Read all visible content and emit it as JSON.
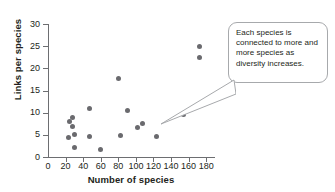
{
  "chart_data": {
    "type": "scatter",
    "title": "",
    "xlabel": "Number of species",
    "ylabel": "Links per species",
    "xlim": [
      0,
      190
    ],
    "ylim": [
      0,
      30
    ],
    "grid": false,
    "legend": null,
    "xticks": [
      0,
      20,
      40,
      60,
      80,
      100,
      120,
      140,
      160,
      180
    ],
    "xtick_labels": [
      "0",
      "20",
      "40",
      "60",
      "80",
      "100",
      "120",
      "140",
      "160",
      "180"
    ],
    "yticks": [
      0,
      5,
      10,
      15,
      20,
      25,
      30
    ],
    "ytick_labels": [
      "0",
      "5",
      "10",
      "15",
      "20",
      "25",
      "30"
    ],
    "marker_color": "#6a6a6e",
    "axis_color": "#6d6e71",
    "points": [
      {
        "x": 24,
        "y": 8.0
      },
      {
        "x": 23,
        "y": 4.3
      },
      {
        "x": 28,
        "y": 8.9
      },
      {
        "x": 28,
        "y": 6.9
      },
      {
        "x": 30,
        "y": 5.0
      },
      {
        "x": 30,
        "y": 2.2
      },
      {
        "x": 47,
        "y": 11.0
      },
      {
        "x": 47,
        "y": 4.6
      },
      {
        "x": 60,
        "y": 1.7
      },
      {
        "x": 80,
        "y": 17.8
      },
      {
        "x": 82,
        "y": 4.8
      },
      {
        "x": 90,
        "y": 10.6
      },
      {
        "x": 102,
        "y": 6.6
      },
      {
        "x": 108,
        "y": 7.5
      },
      {
        "x": 123,
        "y": 4.6
      },
      {
        "x": 154,
        "y": 9.6
      },
      {
        "x": 172,
        "y": 25.0
      },
      {
        "x": 172,
        "y": 22.4
      }
    ]
  },
  "annotation": {
    "text": "Each species is connected to more and more species as diversity increases.",
    "border_color": "#a7a9ac",
    "background": "#ffffff"
  }
}
